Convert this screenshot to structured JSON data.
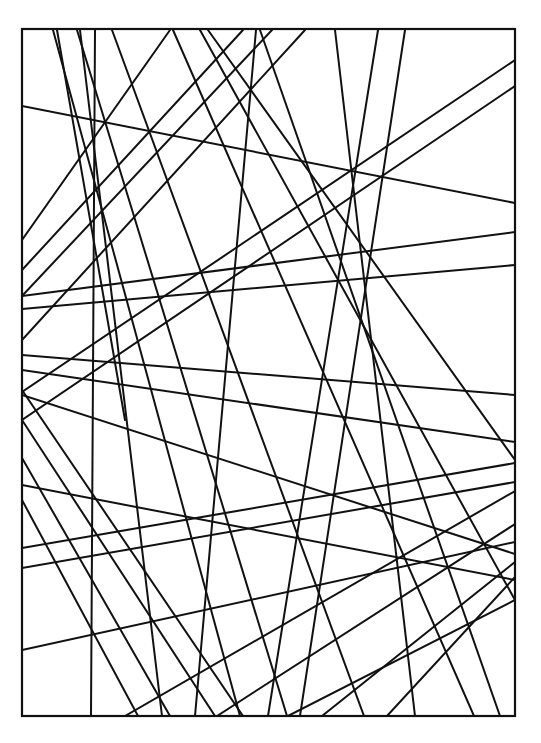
{
  "artwork": {
    "description": "Black line drawing: rectangle filled with many intersecting straight lines",
    "stroke_color": "#111111",
    "background_color": "#ffffff",
    "frame": {
      "x1": 22,
      "y1": 29,
      "x2": 515,
      "y2": 716
    },
    "lines": [
      [
        95,
        30,
        91,
        716
      ],
      [
        53,
        30,
        240,
        716
      ],
      [
        57,
        30,
        125,
        420
      ],
      [
        77,
        30,
        287,
        716
      ],
      [
        80,
        30,
        162,
        716
      ],
      [
        112,
        30,
        364,
        716
      ],
      [
        173,
        30,
        474,
        716
      ],
      [
        208,
        30,
        515,
        460
      ],
      [
        243,
        30,
        22,
        270
      ],
      [
        272,
        30,
        22,
        296
      ],
      [
        256,
        30,
        195,
        716
      ],
      [
        305,
        30,
        22,
        340
      ],
      [
        335,
        30,
        415,
        716
      ],
      [
        378,
        30,
        268,
        716
      ],
      [
        405,
        30,
        300,
        716
      ],
      [
        22,
        106,
        515,
        203
      ],
      [
        515,
        60,
        22,
        392
      ],
      [
        515,
        86,
        22,
        420
      ],
      [
        22,
        296,
        515,
        232
      ],
      [
        22,
        309,
        515,
        265
      ],
      [
        22,
        355,
        515,
        395
      ],
      [
        22,
        370,
        515,
        442
      ],
      [
        22,
        395,
        515,
        554
      ],
      [
        22,
        390,
        243,
        716
      ],
      [
        22,
        420,
        215,
        716
      ],
      [
        22,
        458,
        170,
        716
      ],
      [
        22,
        500,
        138,
        716
      ],
      [
        22,
        548,
        515,
        463
      ],
      [
        22,
        568,
        515,
        482
      ],
      [
        22,
        650,
        515,
        542
      ],
      [
        515,
        491,
        125,
        716
      ],
      [
        515,
        524,
        217,
        716
      ],
      [
        515,
        562,
        322,
        716
      ],
      [
        515,
        577,
        387,
        716
      ],
      [
        515,
        600,
        288,
        716
      ],
      [
        22,
        485,
        515,
        580
      ],
      [
        170,
        30,
        22,
        240
      ],
      [
        200,
        30,
        515,
        600
      ],
      [
        260,
        30,
        500,
        716
      ]
    ]
  }
}
